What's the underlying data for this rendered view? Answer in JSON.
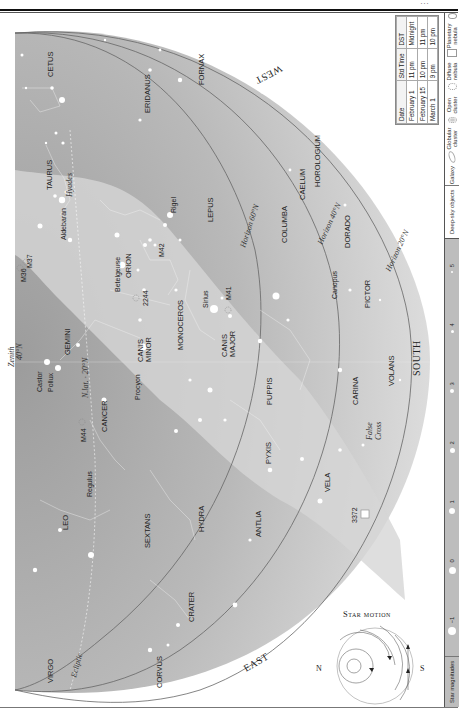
{
  "page": {
    "header_text": "…",
    "orientation": "rotated 90° (landscape chart on portrait page)"
  },
  "map": {
    "directions": {
      "west": "WEST",
      "east": "EAST",
      "south": "SOUTH"
    },
    "zenith": {
      "label": "Zenith",
      "lat": "40°N"
    },
    "horizons": [
      {
        "label": "Horizon 60°N"
      },
      {
        "label": "Horizon 40°N"
      },
      {
        "label": "Horizon 20°N"
      }
    ],
    "ecliptic_label": "Ecliptic",
    "zenith_marks": [
      "N.lat. 20°N",
      "40°N"
    ],
    "constellations": [
      "CETUS",
      "ERIDANUS",
      "FORNAX",
      "TAURUS",
      "ORION",
      "LEPUS",
      "CAELUM",
      "HOROLOGIUM",
      "COLUMBA",
      "DORADO",
      "PICTOR",
      "GEMINI",
      "CANIS MINOR",
      "MONOCEROS",
      "CANIS MAJOR",
      "CANCER",
      "PUPPIS",
      "CARINA",
      "VOLANS",
      "LEO",
      "SEXTANS",
      "HYDRA",
      "PYXIS",
      "VELA",
      "ANTLIA",
      "CRATER",
      "CORVUS",
      "VIRGO"
    ],
    "stars": [
      "Aldebaran",
      "Rigel",
      "Betelgeuse",
      "Sirius",
      "Canopus",
      "Castor",
      "Pollux",
      "Procyon",
      "Regulus"
    ],
    "asterisms": [
      "Hyades",
      "False Cross"
    ],
    "deep_sky": [
      "M36",
      "M37",
      "M42",
      "M41",
      "2244",
      "M44",
      "3372"
    ]
  },
  "time_table": {
    "headers": [
      "Date",
      "Std Time",
      "DST"
    ],
    "rows": [
      [
        "February 1",
        "11 pm",
        "Midnight"
      ],
      [
        "February 15",
        "10 pm",
        "11 pm"
      ],
      [
        "March 1",
        "9 pm",
        "10 pm"
      ]
    ]
  },
  "legend": {
    "star_magnitudes_title": "Star magnitudes",
    "magnitudes": [
      "−1",
      "0",
      "1",
      "2",
      "3",
      "4",
      "5"
    ],
    "deep_sky_title": "Deep-sky objects",
    "deep_sky_types": [
      "Galaxy",
      "Globular cluster",
      "Open cluster",
      "Diffuse nebula",
      "Planetary nebula"
    ]
  },
  "star_motion": {
    "title": "Star motion",
    "left": "N",
    "right": "S"
  }
}
